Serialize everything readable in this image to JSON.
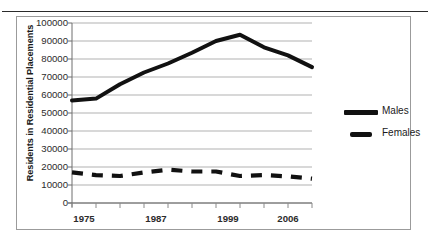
{
  "header": {
    "clipped_text_left": "",
    "clipped_text_right": ""
  },
  "chart_data": {
    "type": "line",
    "title": "",
    "xlabel": "",
    "ylabel": "Residents in Residential Placements",
    "xlim": [
      0,
      10
    ],
    "ylim": [
      0,
      100000
    ],
    "ytick_step": 10000,
    "yticks": [
      "0",
      "10000",
      "20000",
      "30000",
      "40000",
      "50000",
      "60000",
      "70000",
      "80000",
      "90000",
      "100000"
    ],
    "x_tick_count": 11,
    "xtick_labels": [
      "1975",
      "1987",
      "1999",
      "2006"
    ],
    "xtick_label_positions": [
      0.5,
      3.5,
      6.5,
      9.0
    ],
    "grid": "horizontal",
    "legend_position": "right",
    "categories": [
      0,
      1,
      2,
      3,
      4,
      5,
      6,
      7,
      8,
      9,
      10
    ],
    "series": [
      {
        "name": "Males",
        "style": "solid",
        "color": "#111111",
        "values": [
          57000,
          58000,
          66000,
          72500,
          77500,
          83500,
          90000,
          93500,
          86500,
          82000,
          75500
        ]
      },
      {
        "name": "Females",
        "style": "dashed",
        "color": "#111111",
        "values": [
          17000,
          15500,
          15000,
          17000,
          18500,
          17500,
          17500,
          15000,
          15500,
          14800,
          13500
        ]
      }
    ]
  }
}
